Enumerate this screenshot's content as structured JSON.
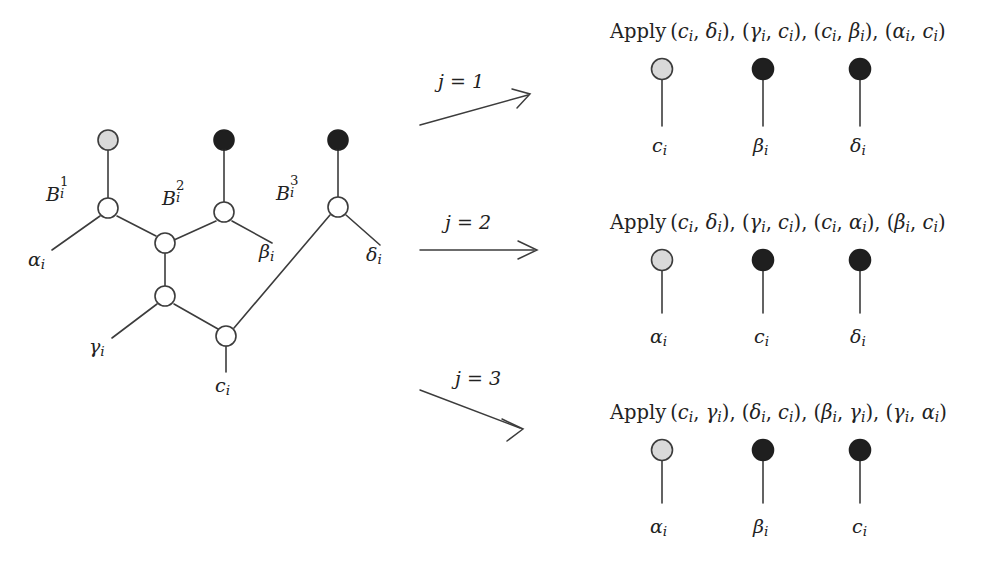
{
  "figure": {
    "background_color": "#ffffff",
    "line_color": "#3c3c3c",
    "node_open_fill": "#ffffff",
    "node_gray_fill": "#d9d9d9",
    "node_black_fill": "#1f1f1f",
    "text_color": "#222222"
  },
  "gadget": {
    "name": "variable-gadget-graph",
    "branch_labels": [
      {
        "base": "B",
        "sup": "1",
        "sub": "i"
      },
      {
        "base": "B",
        "sup": "2",
        "sub": "i"
      },
      {
        "base": "B",
        "sup": "3",
        "sub": "i"
      }
    ],
    "terminal_labels": [
      {
        "base": "α",
        "sub": "i"
      },
      {
        "base": "β",
        "sub": "i"
      },
      {
        "base": "γ",
        "sub": "i"
      },
      {
        "base": "δ",
        "sub": "i"
      },
      {
        "base": "c",
        "sub": "i"
      }
    ],
    "top_node_colors": [
      "gray",
      "black",
      "black"
    ]
  },
  "arrows": [
    {
      "label": "j = 1",
      "direction": "up"
    },
    {
      "label": "j = 2",
      "direction": "straight"
    },
    {
      "label": "j = 3",
      "direction": "down"
    }
  ],
  "panels": [
    {
      "id": "panel-j1",
      "apply_prefix": "Apply",
      "pairs": [
        {
          "first": {
            "base": "c",
            "sub": "i"
          },
          "second": {
            "base": "δ",
            "sub": "i"
          }
        },
        {
          "first": {
            "base": "γ",
            "sub": "i"
          },
          "second": {
            "base": "c",
            "sub": "i"
          }
        },
        {
          "first": {
            "base": "c",
            "sub": "i"
          },
          "second": {
            "base": "β",
            "sub": "i"
          }
        },
        {
          "first": {
            "base": "α",
            "sub": "i"
          },
          "second": {
            "base": "c",
            "sub": "i"
          }
        }
      ],
      "apply_text": "Apply (cᵢ, δᵢ), (γᵢ, cᵢ), (cᵢ, βᵢ), (αᵢ, cᵢ)",
      "stems": [
        {
          "color": "gray",
          "label": {
            "base": "c",
            "sub": "i"
          }
        },
        {
          "color": "black",
          "label": {
            "base": "β",
            "sub": "i"
          }
        },
        {
          "color": "black",
          "label": {
            "base": "δ",
            "sub": "i"
          }
        }
      ]
    },
    {
      "id": "panel-j2",
      "apply_prefix": "Apply",
      "pairs": [
        {
          "first": {
            "base": "c",
            "sub": "i"
          },
          "second": {
            "base": "δ",
            "sub": "i"
          }
        },
        {
          "first": {
            "base": "γ",
            "sub": "i"
          },
          "second": {
            "base": "c",
            "sub": "i"
          }
        },
        {
          "first": {
            "base": "c",
            "sub": "i"
          },
          "second": {
            "base": "α",
            "sub": "i"
          }
        },
        {
          "first": {
            "base": "β",
            "sub": "i"
          },
          "second": {
            "base": "c",
            "sub": "i"
          }
        }
      ],
      "apply_text": "Apply (cᵢ, δᵢ), (γᵢ, cᵢ), (cᵢ, αᵢ), (βᵢ, cᵢ)",
      "stems": [
        {
          "color": "gray",
          "label": {
            "base": "α",
            "sub": "i"
          }
        },
        {
          "color": "black",
          "label": {
            "base": "c",
            "sub": "i"
          }
        },
        {
          "color": "black",
          "label": {
            "base": "δ",
            "sub": "i"
          }
        }
      ]
    },
    {
      "id": "panel-j3",
      "apply_prefix": "Apply",
      "pairs": [
        {
          "first": {
            "base": "c",
            "sub": "i"
          },
          "second": {
            "base": "γ",
            "sub": "i"
          }
        },
        {
          "first": {
            "base": "δ",
            "sub": "i"
          },
          "second": {
            "base": "c",
            "sub": "i"
          }
        },
        {
          "first": {
            "base": "β",
            "sub": "i"
          },
          "second": {
            "base": "γ",
            "sub": "i"
          }
        },
        {
          "first": {
            "base": "γ",
            "sub": "i"
          },
          "second": {
            "base": "α",
            "sub": "i"
          }
        }
      ],
      "apply_text": "Apply (cᵢ, γᵢ), (δᵢ, cᵢ), (βᵢ, γᵢ), (γᵢ, αᵢ)",
      "stems": [
        {
          "color": "gray",
          "label": {
            "base": "α",
            "sub": "i"
          }
        },
        {
          "color": "black",
          "label": {
            "base": "β",
            "sub": "i"
          }
        },
        {
          "color": "black",
          "label": {
            "base": "c",
            "sub": "i"
          }
        }
      ]
    }
  ]
}
